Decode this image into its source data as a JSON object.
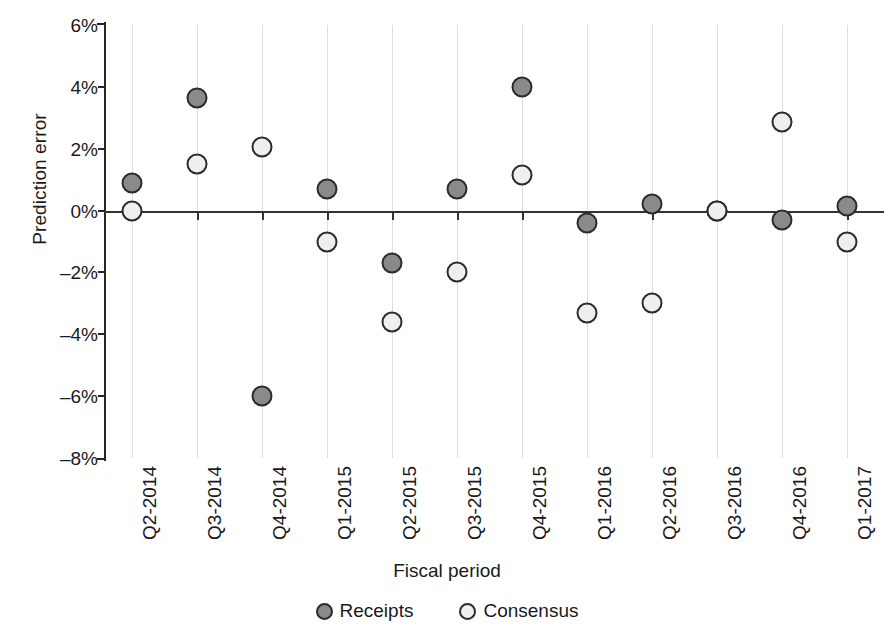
{
  "chart_data": {
    "type": "scatter",
    "title": "",
    "xlabel": "Fiscal period",
    "ylabel": "Prediction error",
    "ylim": [
      -8,
      6
    ],
    "ytick_values": [
      6,
      4,
      2,
      0,
      -2,
      -4,
      -6,
      -8
    ],
    "ytick_labels": [
      "6%",
      "4%",
      "2%",
      "0%",
      "-2%",
      "-4%",
      "-6%",
      "-8%"
    ],
    "grid": "vertical-only",
    "legend_position": "bottom-center",
    "zero_reference_line": true,
    "categories": [
      "Q2-2014",
      "Q3-2014",
      "Q4-2014",
      "Q1-2015",
      "Q2-2015",
      "Q3-2015",
      "Q4-2015",
      "Q1-2016",
      "Q2-2016",
      "Q3-2016",
      "Q4-2016",
      "Q1-2017"
    ],
    "series": [
      {
        "name": "Receipts",
        "color": "#8a8a8a",
        "values": [
          0.9,
          3.65,
          -6.0,
          0.7,
          -1.7,
          0.7,
          4.0,
          -0.4,
          0.2,
          0.0,
          -0.3,
          0.15
        ]
      },
      {
        "name": "Consensus",
        "color": "#efefef",
        "values": [
          0.0,
          1.5,
          2.05,
          -1.0,
          -3.6,
          -2.0,
          1.15,
          -3.3,
          -3.0,
          0.0,
          2.85,
          -1.0
        ]
      }
    ]
  },
  "legend": {
    "items": [
      {
        "label": "Receipts"
      },
      {
        "label": "Consensus"
      }
    ]
  }
}
